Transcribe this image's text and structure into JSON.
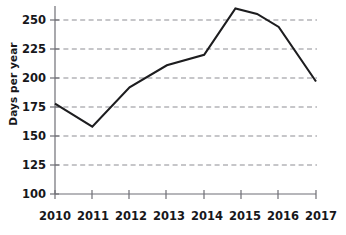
{
  "chart_data": {
    "type": "line",
    "title": "",
    "xlabel": "",
    "ylabel": "Days per year",
    "categories": [
      "2010",
      "2011",
      "2012",
      "2013",
      "2014",
      "2015",
      "2016",
      "2017"
    ],
    "x": [
      2010,
      2011,
      2012,
      2013,
      2014,
      2015,
      2016,
      2017
    ],
    "values": [
      178,
      158,
      192,
      211,
      220,
      260,
      244,
      197
    ],
    "series": [
      {
        "name": "Days per year",
        "values": [
          178,
          158,
          192,
          211,
          220,
          260,
          244,
          197
        ]
      }
    ],
    "ylim": [
      100,
      265
    ],
    "xlim": [
      2010,
      2017
    ],
    "yticks": [
      100,
      125,
      150,
      175,
      200,
      225,
      250
    ],
    "ytick_labels": [
      "100",
      "125",
      "150",
      "175",
      "200",
      "225",
      "250"
    ],
    "xticks": [
      2010,
      2011,
      2012,
      2013,
      2014,
      2015,
      2016,
      2017
    ],
    "xtick_labels": [
      "2010",
      "2011",
      "2012",
      "2013",
      "2014",
      "2015",
      "2016",
      "2017"
    ],
    "grid": true,
    "grid_axis": "y",
    "grid_style": "dashed",
    "legend": false,
    "legend_position": "none",
    "markers": false,
    "line_color": "#1d1d1f",
    "grid_color": "#8d8d93",
    "axis_color": "#6f6f76",
    "text_color": "#17171a",
    "background_color": "#ffffff",
    "annotations": []
  }
}
